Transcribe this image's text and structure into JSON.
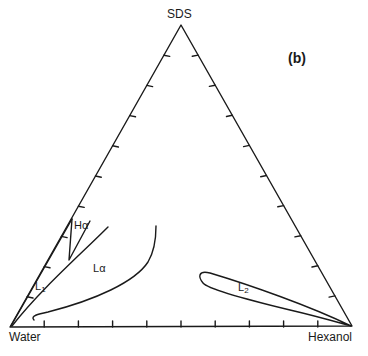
{
  "diagram": {
    "type": "ternary-phase-diagram",
    "panel_label": "(b)",
    "vertices": {
      "top": "SDS",
      "bottom_left": "Water",
      "bottom_right": "Hexanol"
    },
    "ticks_per_side": 9,
    "divisions_per_side": 10,
    "phases": [
      {
        "id": "L1",
        "base": "L",
        "subscript": "1"
      },
      {
        "id": "H_alpha",
        "base": "H",
        "greek": "α"
      },
      {
        "id": "L_alpha",
        "base": "L",
        "greek": "α"
      },
      {
        "id": "L2",
        "base": "L",
        "subscript": "2"
      }
    ],
    "line_color": "#1a1a1a"
  }
}
